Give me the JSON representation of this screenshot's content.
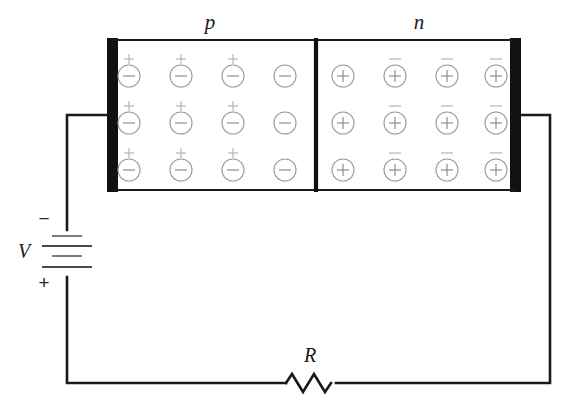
{
  "diagram": {
    "labels": {
      "p_region": "p",
      "n_region": "n",
      "battery": "V",
      "resistor": "R",
      "battery_negative": "−",
      "battery_positive": "+"
    },
    "colors": {
      "ink": "#1a1a1a",
      "electrode": "#111111",
      "carrier_stroke": "#9a9a9a",
      "ion_stroke": "#b4b4b4",
      "background": "#ffffff"
    },
    "p_region": {
      "name": "p",
      "carrier_symbol": "−",
      "ion_symbol": "+",
      "rows": 3,
      "columns": 4,
      "ion_columns": [
        1,
        2,
        3
      ],
      "carrier_cx": [
        129,
        181,
        233,
        285
      ],
      "carrier_cy": [
        76,
        123,
        170
      ]
    },
    "n_region": {
      "name": "n",
      "carrier_symbol": "+",
      "ion_symbol": "−",
      "rows": 3,
      "columns": 4,
      "ion_columns": [
        2,
        3,
        4
      ],
      "carrier_cx": [
        343,
        395,
        447,
        496
      ],
      "carrier_cy": [
        76,
        123,
        170
      ]
    },
    "components": [
      {
        "id": "left-electrode",
        "type": "electrode"
      },
      {
        "id": "right-electrode",
        "type": "electrode"
      },
      {
        "id": "pn-divider",
        "type": "junction"
      },
      {
        "id": "battery",
        "type": "voltage-source",
        "label": "V"
      },
      {
        "id": "resistor",
        "type": "resistor",
        "label": "R"
      }
    ]
  }
}
